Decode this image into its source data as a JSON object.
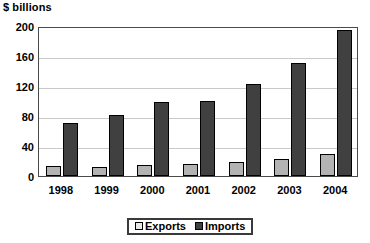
{
  "chart_data": {
    "type": "bar",
    "title": "$ billions",
    "xlabel": "",
    "ylabel": "$ billions",
    "categories": [
      "1998",
      "1999",
      "2000",
      "2001",
      "2002",
      "2003",
      "2004"
    ],
    "series": [
      {
        "name": "Exports",
        "color": "#b3b3b3",
        "values": [
          13,
          12,
          14,
          16,
          18,
          23,
          29
        ]
      },
      {
        "name": "Imports",
        "color": "#404040",
        "values": [
          70,
          81,
          98,
          100,
          123,
          150,
          195
        ]
      }
    ],
    "ylim": [
      0,
      200
    ],
    "yticks": [
      0,
      40,
      80,
      120,
      160,
      200
    ],
    "ytick_labels": [
      "0",
      "40",
      "80",
      "120",
      "160",
      "200"
    ],
    "grid": true,
    "legend_position": "bottom"
  },
  "legend": {
    "items": [
      {
        "label": "Exports",
        "swatch": "exports-swatch"
      },
      {
        "label": "Imports",
        "swatch": "imports-swatch"
      }
    ]
  }
}
